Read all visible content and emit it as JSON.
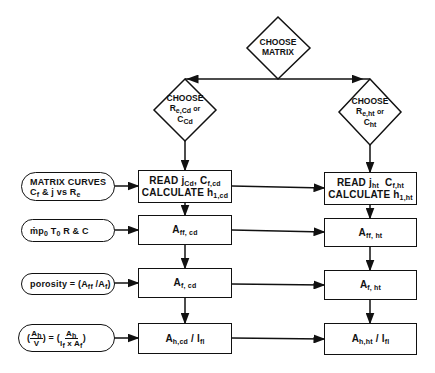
{
  "diagram": {
    "type": "flowchart",
    "top_decision": {
      "line1": "CHOOSE",
      "line2": "MATRIX"
    },
    "left_branch": {
      "decision": {
        "line1": "CHOOSE",
        "r_main": "R",
        "r_sub": "e,Cd",
        "or": "or",
        "c_main": "C",
        "c_sub": "Cd"
      },
      "steps": [
        {
          "read": "READ",
          "j_main": "j",
          "j_sub": "Cd",
          "comma": ",",
          "cf_main": "C",
          "cf_sub": "f,cd",
          "calc": "CALCULATE",
          "h_main": "h",
          "h_sub": "1,cd"
        },
        {
          "main": "A",
          "sub": "ff, cd"
        },
        {
          "main": "A",
          "sub": "f, cd"
        },
        {
          "main": "A",
          "sub": "h,cd",
          "slash": " / ",
          "l_main": "l",
          "l_sub": "fl"
        }
      ]
    },
    "right_branch": {
      "decision": {
        "line1": "CHOOSE",
        "r_main": "R",
        "r_sub": "e,ht",
        "or": "or",
        "c_main": "C",
        "c_sub": "ht"
      },
      "steps": [
        {
          "read": "READ",
          "j_main": "j",
          "j_sub": "ht",
          "cf_main": "C",
          "cf_sub": "f,ht",
          "calc": "CALCULATE",
          "h_main": "h",
          "h_sub": "1,ht"
        },
        {
          "main": "A",
          "sub": "ff, ht"
        },
        {
          "main": "A",
          "sub": "f, ht"
        },
        {
          "main": "A",
          "sub": "h,ht",
          "slash": " / ",
          "l_main": "l",
          "l_sub": "fl"
        }
      ]
    },
    "inputs": [
      {
        "line1": "MATRIX CURVES",
        "line2_a": "C",
        "line2_a_sub": "f",
        "line2_b": " & j vs R",
        "line2_b_sub": "e"
      },
      {
        "m": "ṁ",
        "p": "p",
        "p_sub": "0",
        "t": " T",
        "t_sub": "0",
        "rest": " R & C"
      },
      {
        "label": "porosity = (A",
        "sub1": "ff",
        "mid": " /A",
        "sub2": "f",
        "end": ")"
      },
      {
        "lhs_num_main": "A",
        "lhs_num_sub": "h",
        "lhs_den": "V",
        "eq": " = ",
        "rhs_num_main": "A",
        "rhs_num_sub": "h",
        "rhs_den_a": "l",
        "rhs_den_a_sub": "f",
        "rhs_den_b": " x A",
        "rhs_den_b_sub": "f"
      }
    ]
  }
}
